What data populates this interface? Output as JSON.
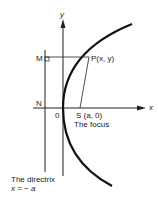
{
  "labels": {
    "y_axis": "y",
    "x_axis": "x",
    "M": "M",
    "P": "P(x, y)",
    "N": "N",
    "O": "0",
    "S": "S (a, 0)",
    "focus": "The focus",
    "directrix_line1": "The directrix",
    "directrix_line2": "x = − a"
  },
  "colors": {
    "stroke": "#222222"
  }
}
